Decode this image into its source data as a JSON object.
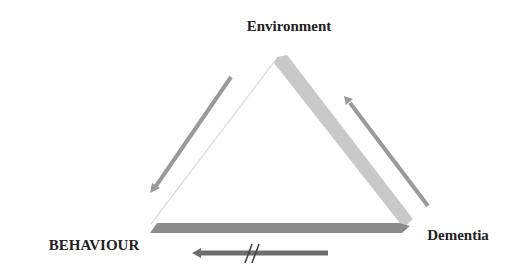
{
  "diagram": {
    "type": "triangular relationship diagram",
    "nodes": {
      "top": {
        "label": "Environment"
      },
      "bottom_left": {
        "label": "BEHAVIOUR"
      },
      "bottom_right": {
        "label": "Dementia"
      }
    },
    "edges": [
      {
        "from": "Environment",
        "to": "BEHAVIOUR",
        "style": "arrow",
        "blocked": false
      },
      {
        "from": "Dementia",
        "to": "Environment",
        "style": "arrow",
        "blocked": false
      },
      {
        "from": "Dementia",
        "to": "BEHAVIOUR",
        "style": "arrow",
        "blocked": true,
        "marker": "//"
      }
    ],
    "colors": {
      "side_right": "#c9c9c9",
      "side_bottom": "#8c8c8c",
      "side_left": "#d8d8d8",
      "arrow_light": "#9a9a9a",
      "arrow_dark": "#6e6e6e",
      "label_text": "#222222",
      "background": "#ffffff"
    }
  }
}
